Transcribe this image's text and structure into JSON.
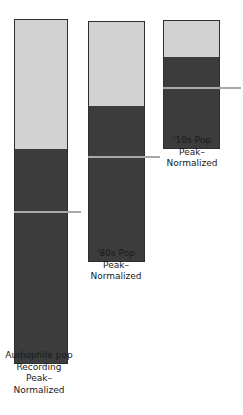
{
  "chart_data": {
    "type": "bar",
    "title": "",
    "subtitle": "",
    "xlabel": "",
    "ylabel": "",
    "grid": false,
    "legend": null,
    "orientation": "vertical",
    "stacked": true,
    "colors": {
      "light_segment": "#d2d2d2",
      "dark_segment": "#3c3c3c",
      "bar_outline": "#2e2e2e",
      "tick_line": "#a8a8a8",
      "background": "#ffffff",
      "label_text": "#1a1a1a"
    },
    "categories": [
      "Audiophile pop Recording Peak-Normalized",
      "'80s Pop Peak-Normalized",
      "'10s Pop Peak-Normalized"
    ],
    "series": [
      {
        "name": "headroom",
        "values": [
          131,
          86,
          38
        ]
      },
      {
        "name": "signal",
        "values": [
          214,
          155,
          129
        ]
      }
    ],
    "annotations": [
      {
        "label": "average level marker",
        "bar": 0,
        "value": 153
      },
      {
        "label": "average level marker",
        "bar": 1,
        "value": 106
      },
      {
        "label": "average level marker",
        "bar": 2,
        "value": 62
      }
    ],
    "bars": [
      {
        "id": "bar-audiophile-pop",
        "label_lines": [
          "Audiophile pop",
          "Recording",
          "Peak–",
          "Normalized"
        ],
        "x": 14,
        "width": 54,
        "top": 19,
        "height": 345,
        "light_height": 131,
        "tick_offset": 192,
        "tick_left": 14,
        "tick_width": 67,
        "label_left": -8,
        "label_top": 350,
        "label_width": 94
      },
      {
        "id": "bar-80s-pop",
        "label_lines": [
          "'80s Pop",
          "Peak–",
          "Normalized"
        ],
        "x": 88,
        "width": 57,
        "top": 21,
        "height": 241,
        "light_height": 86,
        "tick_offset": 135,
        "tick_left": 88,
        "tick_width": 72,
        "label_left": 66,
        "label_top": 248,
        "label_width": 100
      },
      {
        "id": "bar-10s-pop",
        "label_lines": [
          "'10s Pop",
          "Peak–",
          "Normalized"
        ],
        "x": 163,
        "width": 57,
        "top": 20,
        "height": 129,
        "light_height": 38,
        "tick_offset": 67,
        "tick_left": 163,
        "tick_width": 78,
        "label_left": 142,
        "label_top": 135,
        "label_width": 100
      }
    ]
  }
}
